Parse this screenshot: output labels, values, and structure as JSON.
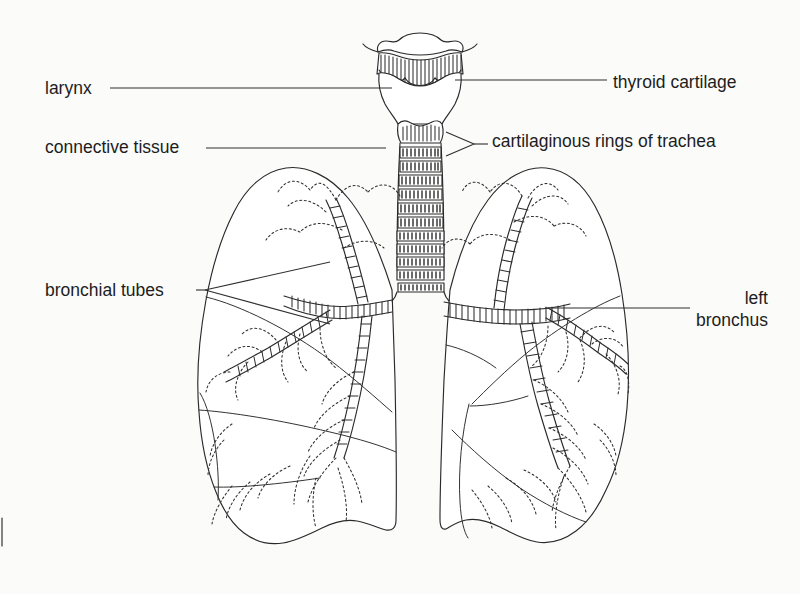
{
  "figure": {
    "type": "line-drawing",
    "background_color": "#fbfbfa",
    "ink_color": "#1d1d1d"
  },
  "labels": {
    "larynx": "larynx",
    "connective_tissue": "connective tissue",
    "bronchial_tubes": "bronchial tubes",
    "thyroid_cartilage": "thyroid cartilage",
    "cartilaginous_rings": "cartilaginous rings of trachea",
    "left_bronchus_line1": "left",
    "left_bronchus_line2": "bronchus"
  },
  "structures": {
    "larynx": "larynx",
    "trachea": "trachea",
    "right_lung": "right lung",
    "left_lung": "left lung",
    "bronchial_tree": "bronchial tree",
    "trachea_ring_count": 14
  }
}
